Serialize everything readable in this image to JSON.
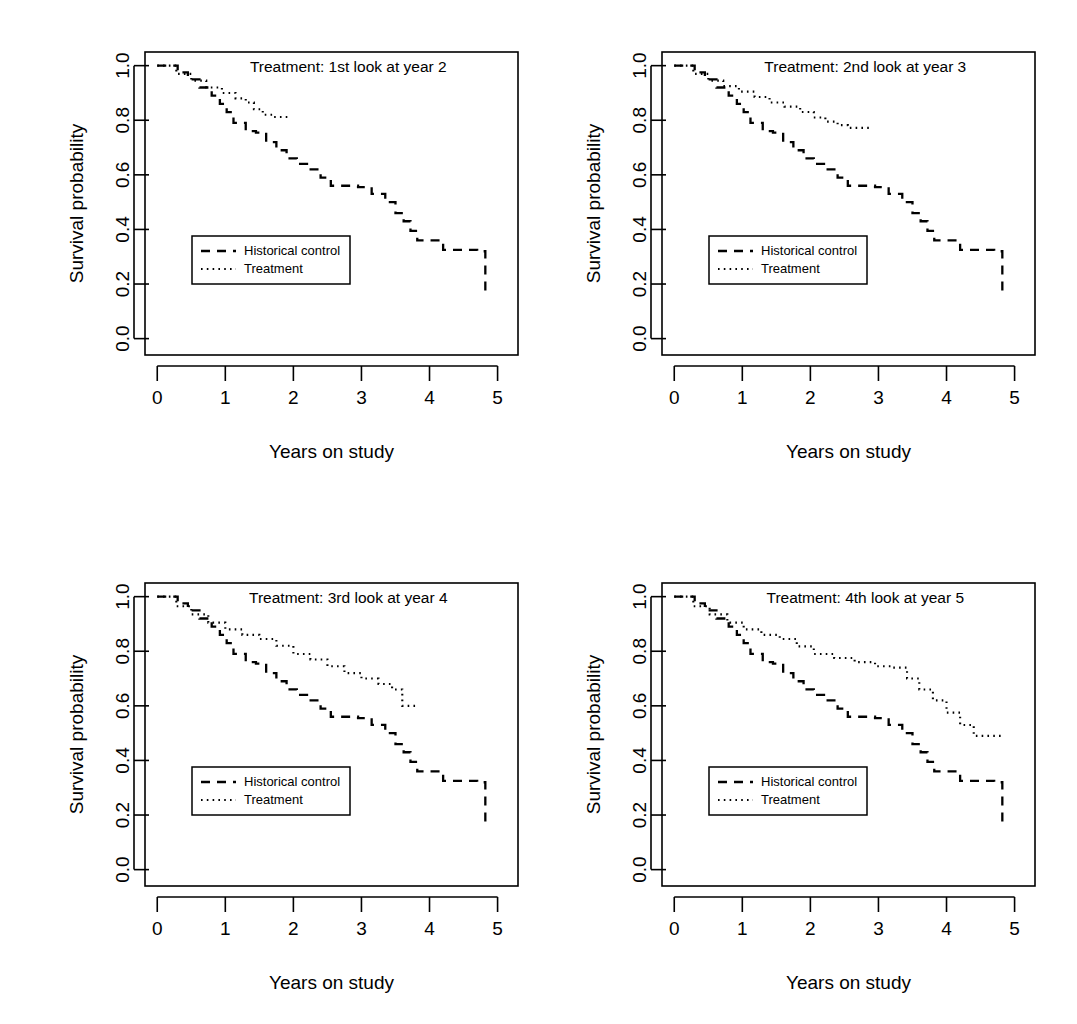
{
  "figure": {
    "type": "multi-panel-survival-figure",
    "panel_count": 4,
    "layout": "2x2",
    "axis_titles": {
      "x": "Years on study",
      "y": "Survival probability"
    },
    "legend": {
      "control_label": "Historical control",
      "treatment_label": "Treatment"
    }
  },
  "chart_data": [
    {
      "type": "line",
      "id": "panel-1",
      "title": "Treatment: 1st look at year 2",
      "xlabel": "Years on study",
      "ylabel": "Survival probability",
      "xlim": [
        -0.18,
        5.3
      ],
      "ylim": [
        -0.06,
        1.05
      ],
      "xticks": [
        0,
        1,
        2,
        3,
        4,
        5
      ],
      "xtick_labels": [
        "0",
        "1",
        "2",
        "3",
        "4",
        "5"
      ],
      "yticks": [
        0.0,
        0.2,
        0.4,
        0.6,
        0.8,
        1.0
      ],
      "ytick_labels": [
        "0.0",
        "0.2",
        "0.4",
        "0.6",
        "0.8",
        "1.0"
      ],
      "grid": false,
      "legend_position": "center-left",
      "series": [
        {
          "name": "Historical control",
          "style": "dashed",
          "x": [
            0.0,
            0.3,
            0.3,
            0.45,
            0.45,
            0.62,
            0.62,
            0.8,
            0.8,
            0.92,
            0.92,
            1.02,
            1.02,
            1.12,
            1.12,
            1.3,
            1.3,
            1.45,
            1.45,
            1.6,
            1.6,
            1.75,
            1.75,
            1.9,
            1.9,
            2.05,
            2.05,
            2.2,
            2.2,
            2.4,
            2.4,
            2.55,
            2.55,
            2.95,
            2.95,
            3.15,
            3.15,
            3.35,
            3.35,
            3.5,
            3.5,
            3.62,
            3.62,
            3.72,
            3.72,
            3.82,
            3.82,
            4.2,
            4.2,
            4.7,
            4.7,
            4.82,
            4.82
          ],
          "y": [
            1.0,
            1.0,
            0.975,
            0.975,
            0.95,
            0.95,
            0.92,
            0.92,
            0.89,
            0.89,
            0.86,
            0.86,
            0.83,
            0.83,
            0.79,
            0.79,
            0.76,
            0.76,
            0.755,
            0.755,
            0.72,
            0.72,
            0.69,
            0.69,
            0.66,
            0.66,
            0.64,
            0.64,
            0.62,
            0.62,
            0.59,
            0.59,
            0.56,
            0.56,
            0.555,
            0.555,
            0.53,
            0.53,
            0.5,
            0.5,
            0.46,
            0.46,
            0.43,
            0.43,
            0.395,
            0.395,
            0.36,
            0.36,
            0.325,
            0.325,
            0.32,
            0.32,
            0.16
          ]
        },
        {
          "name": "Treatment",
          "style": "dotted",
          "x": [
            0.0,
            0.28,
            0.28,
            0.5,
            0.5,
            0.72,
            0.72,
            0.95,
            0.95,
            1.15,
            1.15,
            1.3,
            1.3,
            1.42,
            1.42,
            1.55,
            1.55,
            1.7,
            1.7,
            1.96
          ],
          "y": [
            1.0,
            1.0,
            0.97,
            0.97,
            0.945,
            0.945,
            0.92,
            0.92,
            0.9,
            0.9,
            0.88,
            0.88,
            0.865,
            0.865,
            0.84,
            0.84,
            0.82,
            0.82,
            0.812,
            0.812
          ]
        }
      ]
    },
    {
      "type": "line",
      "id": "panel-2",
      "title": "Treatment: 2nd look at year 3",
      "xlabel": "Years on study",
      "ylabel": "Survival probability",
      "xlim": [
        -0.18,
        5.3
      ],
      "ylim": [
        -0.06,
        1.05
      ],
      "xticks": [
        0,
        1,
        2,
        3,
        4,
        5
      ],
      "xtick_labels": [
        "0",
        "1",
        "2",
        "3",
        "4",
        "5"
      ],
      "yticks": [
        0.0,
        0.2,
        0.4,
        0.6,
        0.8,
        1.0
      ],
      "ytick_labels": [
        "0.0",
        "0.2",
        "0.4",
        "0.6",
        "0.8",
        "1.0"
      ],
      "grid": false,
      "legend_position": "center-left",
      "series": [
        {
          "name": "Historical control",
          "style": "dashed",
          "x": [
            0.0,
            0.3,
            0.3,
            0.45,
            0.45,
            0.62,
            0.62,
            0.8,
            0.8,
            0.92,
            0.92,
            1.02,
            1.02,
            1.12,
            1.12,
            1.3,
            1.3,
            1.45,
            1.45,
            1.6,
            1.6,
            1.75,
            1.75,
            1.9,
            1.9,
            2.05,
            2.05,
            2.2,
            2.2,
            2.4,
            2.4,
            2.55,
            2.55,
            2.95,
            2.95,
            3.15,
            3.15,
            3.35,
            3.35,
            3.5,
            3.5,
            3.62,
            3.62,
            3.72,
            3.72,
            3.82,
            3.82,
            4.2,
            4.2,
            4.7,
            4.7,
            4.82,
            4.82
          ],
          "y": [
            1.0,
            1.0,
            0.975,
            0.975,
            0.95,
            0.95,
            0.92,
            0.92,
            0.89,
            0.89,
            0.86,
            0.86,
            0.83,
            0.83,
            0.79,
            0.79,
            0.76,
            0.76,
            0.755,
            0.755,
            0.72,
            0.72,
            0.69,
            0.69,
            0.66,
            0.66,
            0.64,
            0.64,
            0.62,
            0.62,
            0.59,
            0.59,
            0.56,
            0.56,
            0.555,
            0.555,
            0.53,
            0.53,
            0.5,
            0.5,
            0.46,
            0.46,
            0.43,
            0.43,
            0.395,
            0.395,
            0.36,
            0.36,
            0.325,
            0.325,
            0.32,
            0.32,
            0.16
          ]
        },
        {
          "name": "Treatment",
          "style": "dotted",
          "x": [
            0.0,
            0.28,
            0.28,
            0.5,
            0.5,
            0.72,
            0.72,
            0.95,
            0.95,
            1.18,
            1.18,
            1.4,
            1.4,
            1.62,
            1.62,
            1.85,
            1.85,
            2.05,
            2.05,
            2.22,
            2.22,
            2.4,
            2.4,
            2.55,
            2.55,
            2.9
          ],
          "y": [
            1.0,
            1.0,
            0.97,
            0.97,
            0.945,
            0.945,
            0.925,
            0.925,
            0.905,
            0.905,
            0.885,
            0.885,
            0.865,
            0.865,
            0.85,
            0.85,
            0.83,
            0.83,
            0.81,
            0.81,
            0.795,
            0.795,
            0.782,
            0.782,
            0.772,
            0.772
          ]
        }
      ]
    },
    {
      "type": "line",
      "id": "panel-3",
      "title": "Treatment: 3rd look at year 4",
      "xlabel": "Years on study",
      "ylabel": "Survival probability",
      "xlim": [
        -0.18,
        5.3
      ],
      "ylim": [
        -0.06,
        1.05
      ],
      "xticks": [
        0,
        1,
        2,
        3,
        4,
        5
      ],
      "xtick_labels": [
        "0",
        "1",
        "2",
        "3",
        "4",
        "5"
      ],
      "yticks": [
        0.0,
        0.2,
        0.4,
        0.6,
        0.8,
        1.0
      ],
      "ytick_labels": [
        "0.0",
        "0.2",
        "0.4",
        "0.6",
        "0.8",
        "1.0"
      ],
      "grid": false,
      "legend_position": "center-left",
      "series": [
        {
          "name": "Historical control",
          "style": "dashed",
          "x": [
            0.0,
            0.3,
            0.3,
            0.45,
            0.45,
            0.62,
            0.62,
            0.8,
            0.8,
            0.92,
            0.92,
            1.02,
            1.02,
            1.12,
            1.12,
            1.3,
            1.3,
            1.45,
            1.45,
            1.6,
            1.6,
            1.75,
            1.75,
            1.9,
            1.9,
            2.05,
            2.05,
            2.2,
            2.2,
            2.4,
            2.4,
            2.55,
            2.55,
            2.95,
            2.95,
            3.15,
            3.15,
            3.35,
            3.35,
            3.5,
            3.5,
            3.62,
            3.62,
            3.72,
            3.72,
            3.82,
            3.82,
            4.2,
            4.2,
            4.7,
            4.7,
            4.82,
            4.82
          ],
          "y": [
            1.0,
            1.0,
            0.975,
            0.975,
            0.95,
            0.95,
            0.92,
            0.92,
            0.89,
            0.89,
            0.86,
            0.86,
            0.83,
            0.83,
            0.79,
            0.79,
            0.76,
            0.76,
            0.755,
            0.755,
            0.72,
            0.72,
            0.69,
            0.69,
            0.66,
            0.66,
            0.64,
            0.64,
            0.62,
            0.62,
            0.59,
            0.59,
            0.56,
            0.56,
            0.555,
            0.555,
            0.53,
            0.53,
            0.5,
            0.5,
            0.46,
            0.46,
            0.43,
            0.43,
            0.395,
            0.395,
            0.36,
            0.36,
            0.325,
            0.325,
            0.32,
            0.32,
            0.16
          ]
        },
        {
          "name": "Treatment",
          "style": "dotted",
          "x": [
            0.0,
            0.28,
            0.28,
            0.5,
            0.5,
            0.75,
            0.75,
            1.0,
            1.0,
            1.25,
            1.25,
            1.5,
            1.5,
            1.75,
            1.75,
            2.0,
            2.0,
            2.25,
            2.25,
            2.5,
            2.5,
            2.75,
            2.75,
            3.0,
            3.0,
            3.25,
            3.25,
            3.45,
            3.45,
            3.6,
            3.6,
            3.82
          ],
          "y": [
            1.0,
            1.0,
            0.965,
            0.965,
            0.935,
            0.935,
            0.905,
            0.905,
            0.88,
            0.88,
            0.86,
            0.86,
            0.845,
            0.845,
            0.82,
            0.82,
            0.79,
            0.79,
            0.77,
            0.77,
            0.745,
            0.745,
            0.72,
            0.72,
            0.7,
            0.7,
            0.68,
            0.68,
            0.66,
            0.66,
            0.6,
            0.6
          ]
        }
      ]
    },
    {
      "type": "line",
      "id": "panel-4",
      "title": "Treatment: 4th look at year 5",
      "xlabel": "Years on study",
      "ylabel": "Survival probability",
      "xlim": [
        -0.18,
        5.3
      ],
      "ylim": [
        -0.06,
        1.05
      ],
      "xticks": [
        0,
        1,
        2,
        3,
        4,
        5
      ],
      "xtick_labels": [
        "0",
        "1",
        "2",
        "3",
        "4",
        "5"
      ],
      "yticks": [
        0.0,
        0.2,
        0.4,
        0.6,
        0.8,
        1.0
      ],
      "ytick_labels": [
        "0.0",
        "0.2",
        "0.4",
        "0.6",
        "0.8",
        "1.0"
      ],
      "grid": false,
      "legend_position": "center-left",
      "series": [
        {
          "name": "Historical control",
          "style": "dashed",
          "x": [
            0.0,
            0.3,
            0.3,
            0.45,
            0.45,
            0.62,
            0.62,
            0.8,
            0.8,
            0.92,
            0.92,
            1.02,
            1.02,
            1.12,
            1.12,
            1.3,
            1.3,
            1.45,
            1.45,
            1.6,
            1.6,
            1.75,
            1.75,
            1.9,
            1.9,
            2.05,
            2.05,
            2.2,
            2.2,
            2.4,
            2.4,
            2.55,
            2.55,
            2.95,
            2.95,
            3.15,
            3.15,
            3.35,
            3.35,
            3.5,
            3.5,
            3.62,
            3.62,
            3.72,
            3.72,
            3.82,
            3.82,
            4.2,
            4.2,
            4.7,
            4.7,
            4.82,
            4.82
          ],
          "y": [
            1.0,
            1.0,
            0.975,
            0.975,
            0.95,
            0.95,
            0.92,
            0.92,
            0.89,
            0.89,
            0.86,
            0.86,
            0.83,
            0.83,
            0.79,
            0.79,
            0.76,
            0.76,
            0.755,
            0.755,
            0.72,
            0.72,
            0.69,
            0.69,
            0.66,
            0.66,
            0.64,
            0.64,
            0.62,
            0.62,
            0.59,
            0.59,
            0.56,
            0.56,
            0.555,
            0.555,
            0.53,
            0.53,
            0.5,
            0.5,
            0.46,
            0.46,
            0.43,
            0.43,
            0.395,
            0.395,
            0.36,
            0.36,
            0.325,
            0.325,
            0.32,
            0.32,
            0.16
          ]
        },
        {
          "name": "Treatment",
          "style": "dotted",
          "x": [
            0.0,
            0.28,
            0.28,
            0.52,
            0.52,
            0.78,
            0.78,
            1.02,
            1.02,
            1.28,
            1.28,
            1.55,
            1.55,
            1.8,
            1.8,
            2.05,
            2.05,
            2.35,
            2.35,
            2.65,
            2.65,
            2.95,
            2.95,
            3.2,
            3.2,
            3.42,
            3.42,
            3.6,
            3.6,
            3.8,
            3.8,
            4.0,
            4.0,
            4.2,
            4.2,
            4.4,
            4.4,
            4.8
          ],
          "y": [
            1.0,
            1.0,
            0.965,
            0.965,
            0.935,
            0.935,
            0.905,
            0.905,
            0.88,
            0.88,
            0.86,
            0.86,
            0.845,
            0.845,
            0.818,
            0.818,
            0.79,
            0.79,
            0.775,
            0.775,
            0.76,
            0.76,
            0.745,
            0.745,
            0.74,
            0.74,
            0.7,
            0.7,
            0.66,
            0.66,
            0.62,
            0.62,
            0.575,
            0.575,
            0.53,
            0.53,
            0.49,
            0.49,
            0.478,
            0.478
          ]
        }
      ]
    }
  ]
}
